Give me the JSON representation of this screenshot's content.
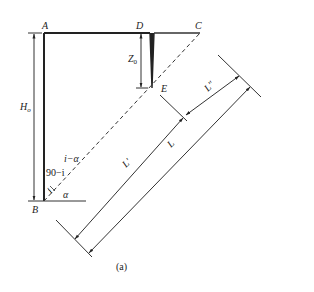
{
  "figure": {
    "caption": "(a)",
    "points": {
      "A": "A",
      "B": "B",
      "C": "C",
      "D": "D",
      "E": "E"
    },
    "dimensions": {
      "wall_height": "H",
      "wall_height_sub": "o",
      "crack_depth": "Z",
      "crack_depth_sub": "0",
      "length_total": "L",
      "length_prime": "L′",
      "length_double_prime": "L″"
    },
    "angles": {
      "i_minus_alpha": "i−α",
      "ninety_minus_i": "90−i",
      "i": "i",
      "alpha": "α"
    }
  }
}
